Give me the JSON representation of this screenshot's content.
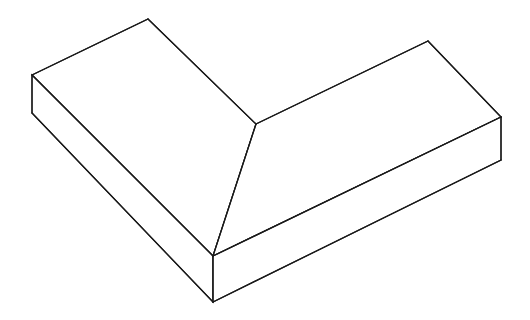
{
  "figure": {
    "background_color": "#ffffff",
    "line_color": "#1a1a1a",
    "fill_color": "#ffffff",
    "line_width": 1.25,
    "projection": "isometric",
    "canvas": {
      "width": 530,
      "height": 320
    },
    "vertices": {
      "left_top_outer": [
        32,
        75
      ],
      "left_bottom_outer": [
        32,
        113
      ],
      "left_apex": [
        148,
        19
      ],
      "inner_ridge_junction": [
        256,
        124
      ],
      "front_corner_top": [
        213,
        256
      ],
      "front_corner_bottom": [
        213,
        302
      ],
      "right_apex": [
        428,
        41
      ],
      "right_top_outer": [
        501,
        117
      ],
      "right_bottom_outer": [
        501,
        160
      ]
    },
    "faces": [
      {
        "name": "left-top-slope-face",
        "points": "32,75 148,19 256,124 213,256"
      },
      {
        "name": "right-top-slope-face",
        "points": "256,124 428,41 501,117 213,256"
      },
      {
        "name": "left-front-side-face",
        "points": "32,75 213,256 213,302 32,113"
      },
      {
        "name": "right-front-side-face",
        "points": "213,256 501,117 501,160 213,302"
      },
      {
        "name": "left-end-face",
        "points": "32,75 32,113"
      }
    ],
    "edges": [
      {
        "name": "left-outer-vertical-edge",
        "d": "M32,75 L32,113"
      },
      {
        "name": "right-outer-vertical-edge",
        "d": "M501,117 L501,160"
      },
      {
        "name": "front-corner-vertical-edge",
        "d": "M213,256 L213,302"
      },
      {
        "name": "inner-ridge-to-front-corner-edge",
        "d": "M256,124 L213,256"
      },
      {
        "name": "left-slope-top-edge",
        "d": "M32,75 L148,19"
      },
      {
        "name": "left-slope-inner-edge",
        "d": "M148,19 L256,124"
      },
      {
        "name": "right-slope-inner-edge",
        "d": "M256,124 L428,41"
      },
      {
        "name": "right-slope-top-edge",
        "d": "M428,41 L501,117"
      },
      {
        "name": "left-face-top-edge",
        "d": "M32,75 L213,256"
      },
      {
        "name": "left-face-bottom-edge",
        "d": "M32,113 L213,302"
      },
      {
        "name": "right-face-top-edge",
        "d": "M213,256 L501,117"
      },
      {
        "name": "right-face-bottom-edge",
        "d": "M213,302 L501,160"
      }
    ]
  }
}
